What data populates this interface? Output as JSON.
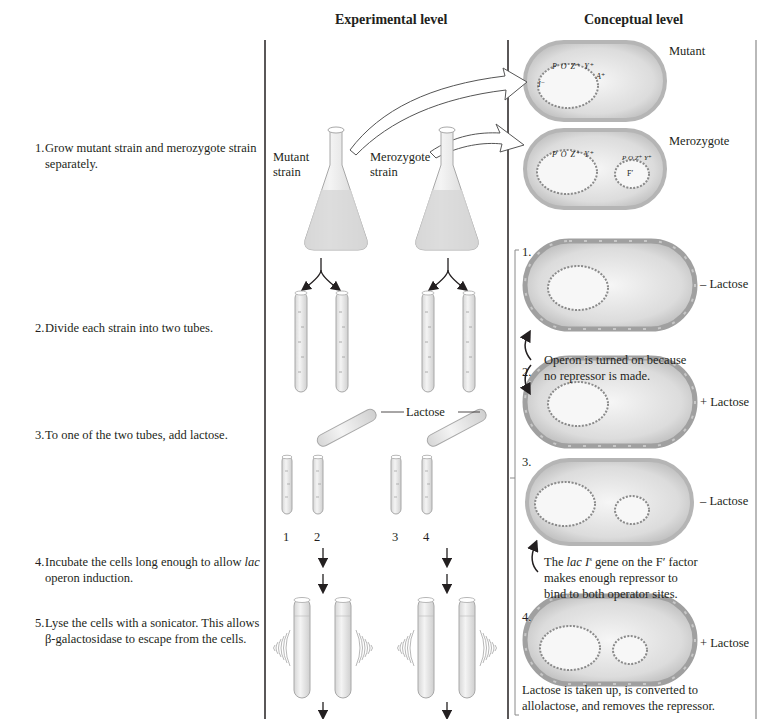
{
  "headers": {
    "experimental": "Experimental level",
    "conceptual": "Conceptual level"
  },
  "steps": [
    {
      "num": "1.",
      "text": "Grow mutant strain and merozygote strain separately."
    },
    {
      "num": "2.",
      "text": "Divide each strain into two tubes."
    },
    {
      "num": "3.",
      "text": "To one of the two tubes, add lactose."
    },
    {
      "num": "4.",
      "text_italic": "lac",
      "text": " operon induction.",
      "text_pre": "Incubate the cells long enough to allow"
    },
    {
      "num": "5.",
      "text": "Lyse the cells with a sonicator. This allows β-galactosidase to escape from the cells."
    }
  ],
  "experimental": {
    "flask_labels": [
      "Mutant strain",
      "Merozygote strain"
    ],
    "flask_label_lines": [
      [
        "Mutant",
        "strain"
      ],
      [
        "Merozygote",
        "strain"
      ]
    ],
    "lactose_label": "Lactose",
    "tube_numbers": [
      "1",
      "2",
      "3",
      "4"
    ]
  },
  "conceptual": {
    "top_cells": [
      {
        "label": "Mutant",
        "genes": [
          "P",
          "O",
          "Z⁺",
          "Y⁺",
          "I⁻",
          "A⁺"
        ]
      },
      {
        "label": "Merozygote",
        "genes": [
          "P",
          "O",
          "Z⁺",
          "Y⁺",
          "I⁻",
          "A⁺"
        ],
        "f_genes": [
          "P",
          "O",
          "Z⁺",
          "Y⁺",
          "I⁺",
          "A⁺",
          "F′"
        ]
      }
    ],
    "panels": [
      {
        "num": "1.",
        "condition": "– Lactose"
      },
      {
        "num": "2.",
        "condition": "+ Lactose"
      },
      {
        "num": "3.",
        "condition": "– Lactose"
      },
      {
        "num": "4.",
        "condition": "+ Lactose"
      }
    ],
    "caption_1_2": [
      "Operon is turned on because",
      "no repressor is made."
    ],
    "caption_3": {
      "pre": "The ",
      "italic": "lac I",
      "sup": "s",
      "post": " gene on the F′ factor",
      "line2": "makes enough repressor to",
      "line3": "bind to both operator sites."
    },
    "caption_4": [
      "Lactose is taken up, is converted to",
      "allolactose, and removes the repressor."
    ]
  },
  "colors": {
    "line": "#231f20",
    "cell_fill": "#d9d9d9",
    "cell_rim": "#bdbdbd",
    "glass": "#e6e6e6",
    "right_border": "#b9b9b9"
  }
}
